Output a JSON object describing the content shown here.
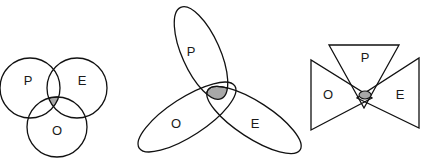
{
  "diagram": {
    "type": "venn-variants",
    "shade_color": "#a8a8a8",
    "stroke_color": "#111111",
    "panels": [
      {
        "name": "circles",
        "shape": "circle",
        "labels": {
          "p": "P",
          "e": "E",
          "o": "O"
        },
        "shaded_region": "P ∩ E ∩ O"
      },
      {
        "name": "ellipses",
        "shape": "ellipse",
        "labels": {
          "p": "P",
          "e": "E",
          "o": "O"
        },
        "shaded_region": "P ∩ E ∩ O"
      },
      {
        "name": "triangles",
        "shape": "triangle",
        "labels": {
          "p": "P",
          "e": "E",
          "o": "O"
        },
        "shaded_region": "P ∩ E ∩ O"
      }
    ]
  }
}
